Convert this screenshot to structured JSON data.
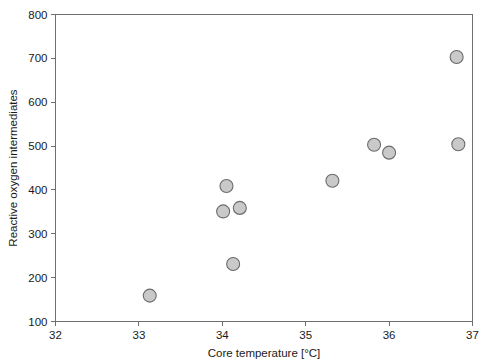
{
  "chart_data": {
    "type": "scatter",
    "title": "",
    "xlabel": "Core temperature [°C]",
    "ylabel": "Reactive oxygen intermediates",
    "xlim": [
      32,
      37
    ],
    "ylim": [
      100,
      800
    ],
    "xticks": [
      32,
      33,
      34,
      35,
      36,
      37
    ],
    "yticks": [
      100,
      200,
      300,
      400,
      500,
      600,
      700,
      800
    ],
    "xtick_labels": [
      "32",
      "33",
      "34",
      "35",
      "36",
      "37"
    ],
    "ytick_labels": [
      "100",
      "200",
      "300",
      "400",
      "500",
      "600",
      "700",
      "800"
    ],
    "grid": false,
    "legend": null,
    "marker": {
      "shape": "circle",
      "fill_color": "#c9c9c9",
      "edge_color": "#6b6b6b",
      "size_px": 13
    },
    "axis_color": "#6f6f6f",
    "background_color": "#ffffff",
    "points": [
      {
        "x": 33.13,
        "y": 159
      },
      {
        "x": 34.01,
        "y": 351
      },
      {
        "x": 34.05,
        "y": 409
      },
      {
        "x": 34.13,
        "y": 231
      },
      {
        "x": 34.21,
        "y": 359
      },
      {
        "x": 35.32,
        "y": 421
      },
      {
        "x": 35.82,
        "y": 503
      },
      {
        "x": 36.0,
        "y": 485
      },
      {
        "x": 36.81,
        "y": 703
      },
      {
        "x": 36.83,
        "y": 504
      }
    ]
  }
}
